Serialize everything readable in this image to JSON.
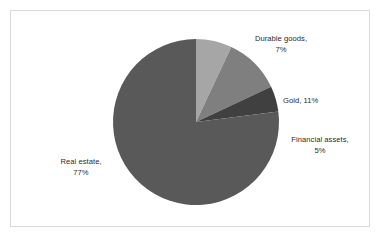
{
  "chart_data": {
    "type": "pie",
    "title": "",
    "subtitle": "",
    "xlabel": "",
    "ylabel": "",
    "legend_position": "none",
    "grid": false,
    "start_angle_deg": 0,
    "direction": "clockwise",
    "categories": [
      "Durable goods",
      "Gold",
      "Financial assets",
      "Real estate"
    ],
    "values": [
      7,
      11,
      5,
      77
    ],
    "value_unit": "percent",
    "colors": [
      "#a6a6a6",
      "#7f7f7f",
      "#404040",
      "#595959"
    ],
    "slices": [
      {
        "name": "Durable goods",
        "value": 7,
        "label": "Durable goods,",
        "label_line2": "7%",
        "color": "#a6a6a6"
      },
      {
        "name": "Gold",
        "value": 11,
        "label": "Gold, 11%",
        "label_line2": "",
        "color": "#7f7f7f"
      },
      {
        "name": "Financial assets",
        "value": 5,
        "label": "Financial assets,",
        "label_line2": "5%",
        "color": "#404040"
      },
      {
        "name": "Real estate",
        "value": 77,
        "label": "Real estate,",
        "label_line2": "77%",
        "color": "#595959"
      }
    ]
  },
  "frame": {
    "border_color": "#d9d9d9",
    "background": "#ffffff"
  },
  "text": {
    "color": "#2b2b2b"
  }
}
